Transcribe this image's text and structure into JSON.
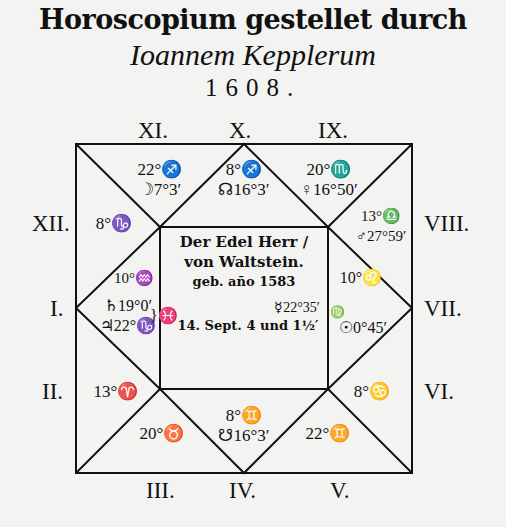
{
  "title": {
    "line1": "Horoscopium gestellet durch",
    "line2": "Ioannem Kepplerum",
    "line3": "1608."
  },
  "houses": {
    "I": "I.",
    "II": "II.",
    "III": "III.",
    "IV": "IV.",
    "V": "V.",
    "VI": "VI.",
    "VII": "VII.",
    "VIII": "VIII.",
    "IX": "IX.",
    "X": "X.",
    "XI": "XI.",
    "XII": "XII."
  },
  "cells": {
    "house_xi": {
      "cusp": "22°♐",
      "planet": "☽7°3′"
    },
    "house_x": {
      "cusp": "8°♐",
      "planet": "☊16°3′"
    },
    "house_ix": {
      "cusp": "20°♏",
      "planet": "♀16°50′"
    },
    "house_xii": {
      "cusp": "8°♑"
    },
    "house_viii": {
      "cusp": "13°♎",
      "planet": "♂27°59′"
    },
    "house_i": {
      "cusp": "10°♒",
      "planet1": "♄19°0′",
      "planet2": "♃22°♑",
      "bracket_sign": "}♓"
    },
    "house_vii": {
      "cusp": "10°♌",
      "sign": "♍",
      "planet": "☉0°45′"
    },
    "house_ii": {
      "cusp": "13°♈"
    },
    "house_vi": {
      "cusp": "8°♋"
    },
    "house_iii": {
      "cusp": "20°♉"
    },
    "house_iv": {
      "cusp": "8°♊",
      "planet": "☋16°3′"
    },
    "house_v": {
      "cusp": "22°♊"
    }
  },
  "center": {
    "line1": "Der Edel Herr /",
    "line2": "von Waltstein.",
    "line3": "geb. año 1583",
    "mercury": "☿22°35′",
    "line4": "14. Sept. 4 und 1½′"
  },
  "colors": {
    "ink": "#111111",
    "paper": "#f3f3f1"
  }
}
